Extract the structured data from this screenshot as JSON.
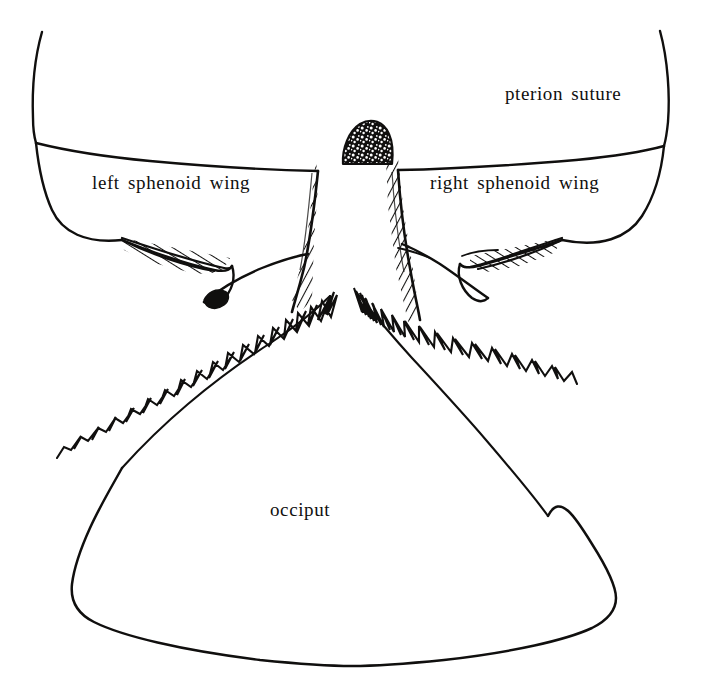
{
  "figure": {
    "kind": "anatomical-line-drawing",
    "background_color": "#ffffff",
    "ink_color": "#100f0e",
    "width": 702,
    "height": 682
  },
  "labels": {
    "pterion_suture": "pterion suture",
    "left_sphenoid_wing": "left sphenoid wing",
    "right_sphenoid_wing": "right sphenoid wing",
    "occiput": "occiput"
  },
  "regions": {
    "pterion_suture_line": "pterion-suture-line",
    "left_wing": "left-sphenoid-wing-outline",
    "right_wing": "right-sphenoid-wing-outline",
    "central_column": "central-hatched-column",
    "stipple_boss": "stippled-boss",
    "left_lambdoid_suture": "left-lambdoid-suture",
    "right_lambdoid_suture": "right-lambdoid-suture",
    "occiput_outline": "occiput-outline",
    "left_hatched_sliver": "left-hatched-sliver",
    "right_hatched_sliver": "right-hatched-sliver",
    "left_black_blob": "left-black-blob"
  }
}
